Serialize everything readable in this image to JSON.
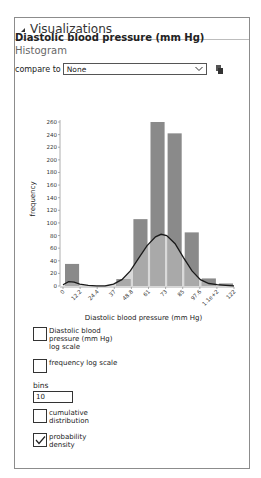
{
  "panel": {
    "title": "Visualizations"
  },
  "variable": {
    "name": "Diastolic blood pressure (mm Hg)",
    "chart_kind": "Histogram"
  },
  "compare": {
    "label": "compare to",
    "selected": "None"
  },
  "icons": {
    "collapse": "collapse-triangle-icon",
    "dropdown": "chevron-down-icon",
    "copy": "copy-icon"
  },
  "controls": {
    "x_log_label": "Diastolic blood pressure (mm Hg) log scale",
    "x_log_checked": false,
    "freq_log_label": "frequency log scale",
    "freq_log_checked": false,
    "bins_label": "bins",
    "bins_value": "10",
    "cumulative_label": "cumulative distribution",
    "cumulative_checked": false,
    "density_label": "probability density",
    "density_checked": true
  },
  "colors": {
    "bar_dark": "#8a8a8a",
    "bar_light": "#a9a9a9",
    "density_fill": "#d9d9d9",
    "curve": "#1a1a1a"
  },
  "chart_data": {
    "type": "bar",
    "title": "",
    "xlabel": "Diastolic blood pressure (mm Hg)",
    "ylabel": "frequency",
    "x_tick_labels": [
      "0",
      "12.2",
      "24.4",
      "37",
      "48.8",
      "61",
      "73",
      "85",
      "97.6",
      "1.1e+2",
      "122"
    ],
    "bin_edges": [
      0,
      12.2,
      24.4,
      36.6,
      48.8,
      61,
      73.2,
      85.4,
      97.6,
      109.8,
      122
    ],
    "values": [
      35,
      0,
      0,
      11,
      106,
      260,
      242,
      85,
      12,
      4
    ],
    "y_ticks": [
      0,
      20,
      40,
      60,
      80,
      100,
      120,
      140,
      160,
      180,
      200,
      220,
      240,
      260
    ],
    "ylim": [
      0,
      260
    ],
    "grid": false,
    "overlay": {
      "type": "line",
      "name": "probability density",
      "x": [
        0,
        4,
        8,
        12,
        18,
        24,
        30,
        36,
        42,
        48,
        54,
        60,
        66,
        70,
        74,
        80,
        86,
        92,
        98,
        104,
        110,
        116,
        122
      ],
      "y": [
        2,
        7,
        6,
        3,
        1,
        0,
        0,
        3,
        10,
        24,
        44,
        64,
        78,
        82,
        80,
        67,
        45,
        24,
        10,
        4,
        2,
        1,
        0
      ]
    }
  }
}
